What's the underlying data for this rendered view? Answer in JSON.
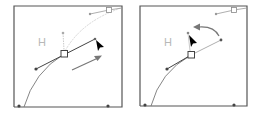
{
  "figure": {
    "panels": [
      {
        "id": "before",
        "handle_label": "H",
        "arrow": "straight",
        "state": "drag handle outward"
      },
      {
        "id": "after",
        "handle_label": "H",
        "arrow": "curved",
        "state": "rotate handle"
      }
    ]
  },
  "colors": {
    "frame": "#555555",
    "curve": "#777777",
    "dim_curve": "#d0d0d0",
    "handle": "#555555",
    "dim_handle": "#bbbbbb",
    "arrow": "#777777",
    "cursor": "#000000",
    "label": "#b8b8b8"
  }
}
